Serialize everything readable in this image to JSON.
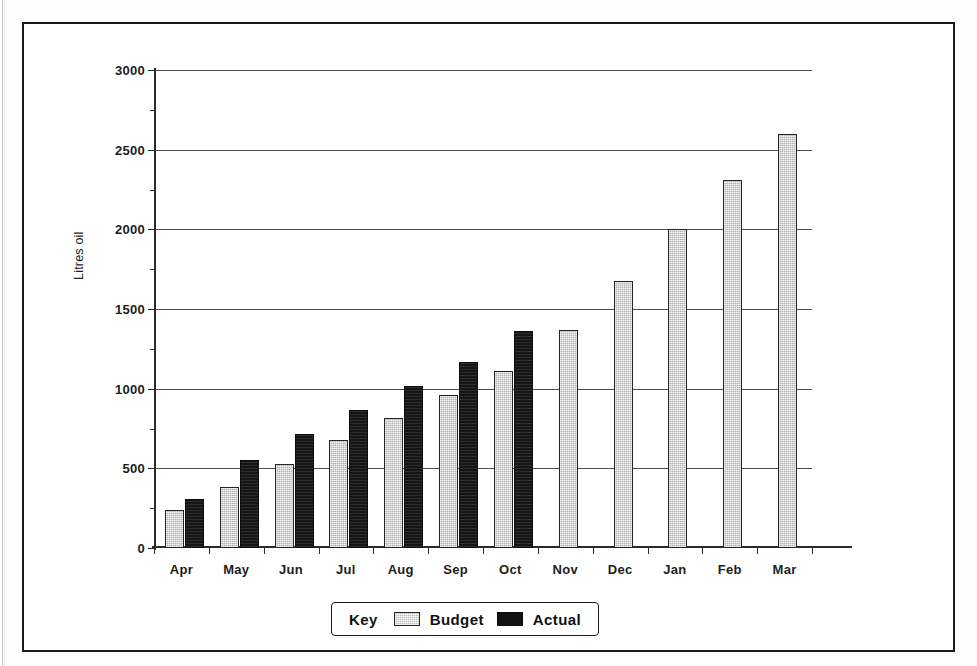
{
  "chart_data": {
    "type": "bar",
    "title": "",
    "xlabel": "",
    "ylabel": "Litres oil",
    "ylim": [
      0,
      3000
    ],
    "ytick_step": 500,
    "yticks": [
      "0",
      "500",
      "1000",
      "1500",
      "2000",
      "2500",
      "3000"
    ],
    "grid": true,
    "legend_position": "bottom-center",
    "legend_title": "Key",
    "categories": [
      "Apr",
      "May",
      "Jun",
      "Jul",
      "Aug",
      "Sep",
      "Oct",
      "Nov",
      "Dec",
      "Jan",
      "Feb",
      "Mar"
    ],
    "series": [
      {
        "name": "Budget",
        "color": "#b4b4b4",
        "values": [
          240,
          385,
          530,
          675,
          815,
          960,
          1110,
          1370,
          1675,
          2000,
          2310,
          2600
        ]
      },
      {
        "name": "Actual",
        "color": "#151515",
        "values": [
          310,
          550,
          715,
          865,
          1015,
          1165,
          1365,
          null,
          null,
          null,
          null,
          null
        ]
      }
    ]
  },
  "legend": {
    "key_label": "Key",
    "entries": [
      {
        "label": "Budget",
        "swatch": "budget"
      },
      {
        "label": "Actual",
        "swatch": "actual"
      }
    ]
  }
}
